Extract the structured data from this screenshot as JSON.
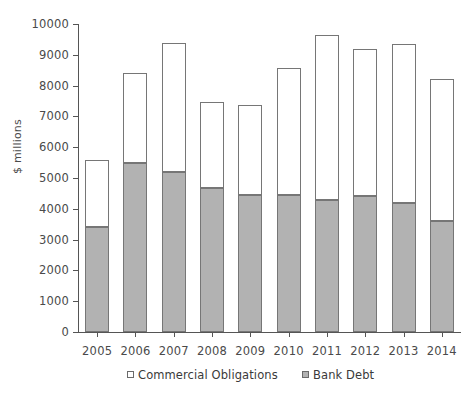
{
  "chart_data": {
    "type": "bar",
    "subtype": "stacked-vertical",
    "title": "",
    "xlabel": "",
    "ylabel": "$ millions",
    "ylim": [
      0,
      10000
    ],
    "ytick_step": 1000,
    "yticks": [
      0,
      1000,
      2000,
      3000,
      4000,
      5000,
      6000,
      7000,
      8000,
      9000,
      10000
    ],
    "ytick_labels": [
      "0",
      "1000",
      "2000",
      "3000",
      "4000",
      "5000",
      "6000",
      "7000",
      "8000",
      "9000",
      "10000"
    ],
    "categories": [
      "2005",
      "2006",
      "2007",
      "2008",
      "2009",
      "2010",
      "2011",
      "2012",
      "2013",
      "2014"
    ],
    "grid": false,
    "legend_position": "bottom",
    "series": [
      {
        "name": "Bank Debt",
        "color": "#b2b2b2",
        "stack_order": "bottom",
        "values": [
          3400,
          5480,
          5200,
          4680,
          4450,
          4450,
          4300,
          4400,
          4180,
          3620
        ]
      },
      {
        "name": "Commercial Obligations",
        "color": "#ffffff",
        "stack_order": "top",
        "values": [
          2170,
          2930,
          4190,
          2790,
          2930,
          4120,
          5330,
          4780,
          5170,
          4580
        ]
      }
    ],
    "totals": [
      5570,
      8410,
      9390,
      7470,
      7380,
      8570,
      9630,
      9180,
      9350,
      8200
    ],
    "legend_entries": [
      {
        "label": "Commercial Obligations",
        "swatch": "white"
      },
      {
        "label": "Bank Debt",
        "swatch": "gray"
      }
    ]
  }
}
